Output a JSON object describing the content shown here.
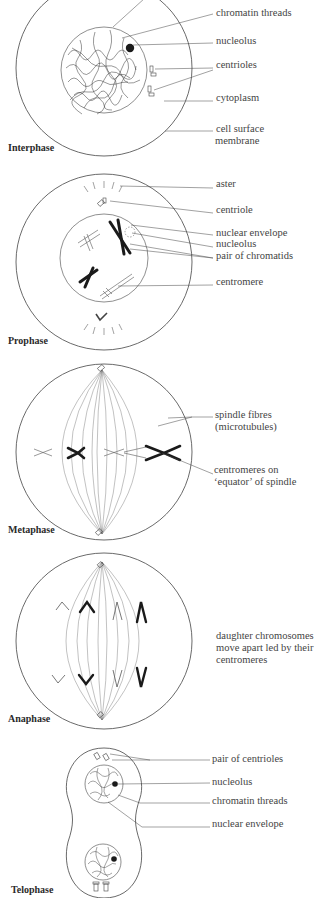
{
  "interphase": {
    "title": "Interphase",
    "labels": {
      "chromatin_threads": "chromatin threads",
      "nucleolus": "nucleolus",
      "centrioles": "centrioles",
      "cytoplasm": "cytoplasm",
      "cell_surface_membrane_1": "cell surface",
      "cell_surface_membrane_2": "membrane"
    }
  },
  "prophase": {
    "title": "Prophase",
    "labels": {
      "aster": "aster",
      "centriole": "centriole",
      "nuclear_envelope": "nuclear envelope",
      "nucleolus": "nucleolus",
      "pair_of_chromatids": "pair of chromatids",
      "centromere": "centromere"
    }
  },
  "metaphase": {
    "title": "Metaphase",
    "labels": {
      "spindle_fibres_1": "spindle fibres",
      "spindle_fibres_2": "(microtubules)",
      "centromeres_1": "centromeres on",
      "centromeres_2": "‘equator’ of spindle"
    }
  },
  "anaphase": {
    "title": "Anaphase",
    "labels": {
      "daughter_1": "daughter chromosomes",
      "daughter_2": "move apart led by their",
      "daughter_3": "centromeres"
    }
  },
  "telophase": {
    "title": "Telophase",
    "labels": {
      "pair_of_centrioles": "pair of centrioles",
      "nucleolus": "nucleolus",
      "chromatin_threads": "chromatin threads",
      "nuclear_envelope": "nuclear envelope"
    }
  },
  "colors": {
    "line": "#444444",
    "text": "#3a3a3a",
    "chromosome_dark": "#1a1a1a"
  }
}
